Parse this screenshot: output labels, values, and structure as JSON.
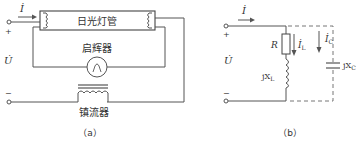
{
  "diagram_a": {
    "current_label": "İ",
    "plus": "+",
    "minus": "−",
    "voltage_label": "U̇",
    "tube_label": "日光灯管",
    "starter_label": "启辉器",
    "ballast_label": "镇流器",
    "caption": "（a）"
  },
  "diagram_b": {
    "current_label": "İ",
    "plus": "+",
    "minus": "−",
    "voltage_label": "U̇",
    "resistor_label": "R",
    "inductor_current_label": "İ",
    "inductor_current_sub": "L",
    "inductor_label": "jX",
    "inductor_label_sub": "L",
    "capacitor_current_label": "İ",
    "capacitor_current_sub": "C",
    "capacitor_label": "jX",
    "capacitor_label_sub": "C",
    "caption": "（b）"
  },
  "colors": {
    "line": "#555555",
    "dashed": "#777777",
    "text": "#333333"
  }
}
